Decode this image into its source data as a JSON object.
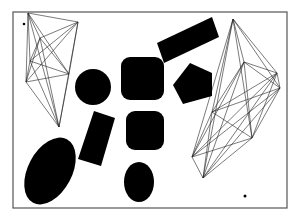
{
  "scene": {
    "background": "#ffffff",
    "frame": {
      "x": 13,
      "y": 12,
      "width": 274,
      "height": 196,
      "stroke": "#555555"
    },
    "fill_color": "#000000",
    "shapes": [
      {
        "name": "rotated-rectangle-top",
        "type": "polygon",
        "points": "157,43 212,17 219,37 164,63"
      },
      {
        "name": "pentagon",
        "type": "polygon",
        "points": "190,63 212,73 212,96 183,104 173,85"
      },
      {
        "name": "circle",
        "type": "circle",
        "cx": 93,
        "cy": 87,
        "r": 18
      },
      {
        "name": "rounded-square-top",
        "type": "rect",
        "x": 121,
        "y": 57,
        "width": 43,
        "height": 43,
        "rx": 9
      },
      {
        "name": "rounded-square-middle",
        "type": "rect",
        "x": 126,
        "y": 111,
        "width": 38,
        "height": 39,
        "rx": 9
      },
      {
        "name": "rotated-rectangle-small",
        "type": "polygon",
        "points": "94,111 115,118 101,166 78,159"
      },
      {
        "name": "ellipse-large",
        "type": "ellipse",
        "cx": 50,
        "cy": 171,
        "rx": 22,
        "ry": 36,
        "rotate": 28
      },
      {
        "name": "ellipse-small",
        "type": "ellipse",
        "cx": 139,
        "cy": 182,
        "rx": 15,
        "ry": 20,
        "rotate": 0
      }
    ],
    "dots": [
      {
        "name": "dot-top-left",
        "cx": 24,
        "cy": 24,
        "r": 1.3
      },
      {
        "name": "dot-bottom-right",
        "cx": 245,
        "cy": 196,
        "r": 1.5
      }
    ],
    "graphs": [
      {
        "name": "complete-graph-left",
        "vertices": [
          [
            28,
            13
          ],
          [
            78,
            22
          ],
          [
            40,
            38
          ],
          [
            30,
            61
          ],
          [
            69,
            74
          ],
          [
            26,
            82
          ],
          [
            59,
            127
          ]
        ]
      },
      {
        "name": "complete-graph-right",
        "vertices": [
          [
            233,
            19
          ],
          [
            277,
            73
          ],
          [
            244,
            62
          ],
          [
            280,
            88
          ],
          [
            212,
            112
          ],
          [
            252,
            138
          ],
          [
            192,
            157
          ],
          [
            203,
            178
          ]
        ]
      }
    ]
  }
}
